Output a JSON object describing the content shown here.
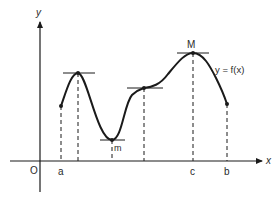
{
  "diagram": {
    "axes": {
      "x_label": "x",
      "y_label": "y",
      "origin_label": "O"
    },
    "x_ticks": [
      {
        "label": "a",
        "x": 61
      },
      {
        "label": "c",
        "x": 193
      },
      {
        "label": "b",
        "x": 227
      }
    ],
    "points": {
      "m_label": "m",
      "M_label": "M"
    },
    "function_label": "y = f(x)",
    "colors": {
      "stroke": "#1a1a1a",
      "text": "#2a2a2a",
      "background": "#ffffff"
    }
  }
}
